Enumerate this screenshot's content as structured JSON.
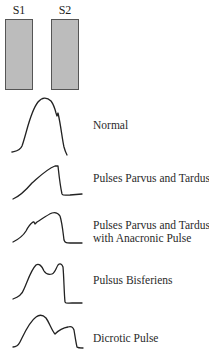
{
  "heart_sounds": [
    {
      "label": "S1",
      "left": 5
    },
    {
      "label": "S2",
      "left": 51
    }
  ],
  "waveforms": [
    {
      "name": "normal",
      "caption_lines": [
        "Normal"
      ],
      "caption_top": 119
    },
    {
      "name": "pulsus-parvus-et-tardus",
      "caption_lines": [
        "Pulses Parvus and Tardus"
      ],
      "caption_top": 172
    },
    {
      "name": "parvus-tardus-anacrotic",
      "caption_lines": [
        "Pulses Parvus and Tardus",
        "with Anacronic Pulse"
      ],
      "caption_top": 219
    },
    {
      "name": "pulsus-bisferiens",
      "caption_lines": [
        "Pulsus Bisferiens"
      ],
      "caption_top": 274
    },
    {
      "name": "dicrotic-pulse",
      "caption_lines": [
        "Dicrotic Pulse"
      ],
      "caption_top": 332
    }
  ],
  "colors": {
    "box_fill": "#bcbcbc",
    "box_border": "#555555",
    "line": "#222222"
  }
}
